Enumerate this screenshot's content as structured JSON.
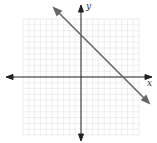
{
  "chart_data": {
    "type": "line",
    "title": "",
    "xlabel": "x",
    "ylabel": "y",
    "xlim": [
      -10,
      10
    ],
    "ylim": [
      -10,
      10
    ],
    "grid": true,
    "series": [
      {
        "name": "line",
        "equation": "y = -x + 7",
        "x": [
          -3,
          11
        ],
        "y": [
          10,
          -4
        ],
        "color": "#666666"
      }
    ],
    "intercepts": {
      "x": 7,
      "y": 7
    }
  },
  "labels": {
    "x_axis": "x",
    "y_axis": "y"
  }
}
